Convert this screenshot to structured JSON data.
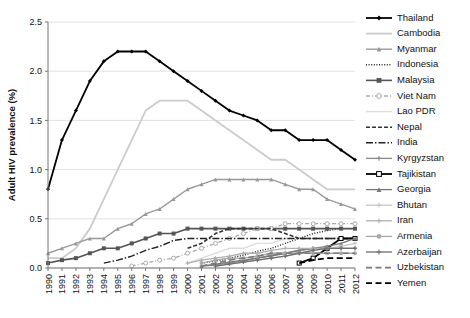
{
  "chart_data": {
    "type": "line",
    "title": "",
    "xlabel": "",
    "ylabel": "Adult HIV prevalence (%)",
    "xlim": [
      1990,
      2012
    ],
    "ylim": [
      0.0,
      2.5
    ],
    "yticks": [
      "0.0",
      "0.5",
      "1.0",
      "1.5",
      "2.0",
      "2.5"
    ],
    "ytick_values": [
      0.0,
      0.5,
      1.0,
      1.5,
      2.0,
      2.5
    ],
    "grid": "horizontal",
    "legend_position": "right",
    "x": [
      1990,
      1991,
      1992,
      1993,
      1994,
      1995,
      1996,
      1997,
      1998,
      1999,
      2000,
      2001,
      2002,
      2003,
      2004,
      2005,
      2006,
      2007,
      2008,
      2009,
      2010,
      2011,
      2012
    ],
    "xtick_labels": [
      "1990",
      "1991",
      "1992",
      "1993",
      "1994",
      "1995",
      "1996",
      "1997",
      "1998",
      "1999",
      "2000",
      "2001",
      "2002",
      "2003",
      "2004",
      "2005",
      "2006",
      "2007",
      "2008",
      "2009",
      "2010",
      "2011",
      "2012"
    ],
    "series": [
      {
        "name": "Thailand",
        "color": "#000000",
        "style": "solid",
        "marker": "diamond",
        "width": 1.8,
        "values": [
          0.8,
          1.3,
          1.6,
          1.9,
          2.1,
          2.2,
          2.2,
          2.2,
          2.1,
          2.0,
          1.9,
          1.8,
          1.7,
          1.6,
          1.55,
          1.5,
          1.4,
          1.4,
          1.3,
          1.3,
          1.3,
          1.2,
          1.1
        ]
      },
      {
        "name": "Cambodia",
        "color": "#cccccc",
        "style": "solid",
        "marker": "none",
        "width": 1.8,
        "values": [
          0.1,
          0.1,
          0.2,
          0.4,
          0.7,
          1.0,
          1.3,
          1.6,
          1.7,
          1.7,
          1.7,
          1.6,
          1.5,
          1.4,
          1.3,
          1.2,
          1.1,
          1.1,
          1.0,
          0.9,
          0.8,
          0.8,
          0.8
        ]
      },
      {
        "name": "Myanmar",
        "color": "#999999",
        "style": "solid",
        "marker": "triangle",
        "width": 1.4,
        "values": [
          0.15,
          0.2,
          0.25,
          0.3,
          0.3,
          0.4,
          0.45,
          0.55,
          0.6,
          0.7,
          0.8,
          0.85,
          0.9,
          0.9,
          0.9,
          0.9,
          0.9,
          0.85,
          0.8,
          0.8,
          0.7,
          0.65,
          0.6
        ]
      },
      {
        "name": "Indonesia",
        "color": "#222222",
        "style": "dotted",
        "marker": "none",
        "width": 1.4,
        "values": [
          null,
          null,
          null,
          null,
          null,
          null,
          null,
          null,
          null,
          null,
          null,
          0.05,
          0.07,
          0.1,
          0.13,
          0.17,
          0.2,
          0.25,
          0.3,
          0.35,
          0.38,
          0.4,
          0.4
        ]
      },
      {
        "name": "Malaysia",
        "color": "#555555",
        "style": "solid",
        "marker": "square",
        "width": 1.6,
        "values": [
          0.05,
          0.08,
          0.1,
          0.15,
          0.2,
          0.2,
          0.25,
          0.3,
          0.35,
          0.35,
          0.4,
          0.4,
          0.4,
          0.4,
          0.4,
          0.4,
          0.4,
          0.4,
          0.4,
          0.4,
          0.4,
          0.4,
          0.4
        ]
      },
      {
        "name": "Viet Nam",
        "color": "#aaaaaa",
        "style": "dashdot",
        "marker": "circle-open",
        "width": 1.3,
        "values": [
          null,
          null,
          null,
          null,
          null,
          null,
          0.02,
          0.05,
          0.08,
          0.1,
          0.15,
          0.2,
          0.25,
          0.3,
          0.35,
          0.4,
          0.4,
          0.45,
          0.45,
          0.45,
          0.45,
          0.45,
          0.45
        ]
      },
      {
        "name": "Lao PDR",
        "color": "#dddddd",
        "style": "solid",
        "marker": "none",
        "width": 1.4,
        "values": [
          null,
          null,
          null,
          null,
          null,
          null,
          null,
          null,
          null,
          null,
          0.05,
          0.1,
          0.15,
          0.2,
          0.2,
          0.25,
          0.25,
          0.3,
          0.3,
          0.3,
          0.3,
          0.3,
          0.3
        ]
      },
      {
        "name": "Nepal",
        "color": "#333333",
        "style": "dashed",
        "marker": "none",
        "width": 1.6,
        "values": [
          null,
          null,
          null,
          null,
          null,
          null,
          null,
          null,
          null,
          null,
          0.2,
          0.25,
          0.35,
          0.4,
          0.4,
          0.4,
          0.4,
          0.35,
          0.3,
          0.3,
          0.3,
          0.3,
          0.3
        ]
      },
      {
        "name": "India",
        "color": "#222222",
        "style": "dashdot-long",
        "marker": "none",
        "width": 1.4,
        "values": [
          null,
          null,
          null,
          null,
          0.05,
          0.08,
          0.12,
          0.18,
          0.22,
          0.28,
          0.3,
          0.3,
          0.3,
          0.3,
          0.3,
          0.3,
          0.3,
          0.3,
          0.3,
          0.3,
          0.3,
          0.3,
          0.3
        ]
      },
      {
        "name": "Kyrgyzstan",
        "color": "#888888",
        "style": "solid",
        "marker": "cross",
        "width": 1.3,
        "values": [
          null,
          null,
          null,
          null,
          null,
          null,
          null,
          null,
          null,
          null,
          null,
          0.02,
          0.03,
          0.05,
          0.07,
          0.1,
          0.13,
          0.15,
          0.18,
          0.2,
          0.2,
          0.2,
          0.2
        ]
      },
      {
        "name": "Tajikistan",
        "color": "#000000",
        "style": "solid",
        "marker": "square-open",
        "width": 1.8,
        "values": [
          null,
          null,
          null,
          null,
          null,
          null,
          null,
          null,
          null,
          null,
          null,
          null,
          null,
          null,
          null,
          null,
          null,
          null,
          0.05,
          0.1,
          0.2,
          0.3,
          0.3
        ]
      },
      {
        "name": "Georgia",
        "color": "#777777",
        "style": "solid",
        "marker": "triangle",
        "width": 1.3,
        "values": [
          null,
          null,
          null,
          null,
          null,
          null,
          null,
          null,
          null,
          null,
          null,
          0.02,
          0.04,
          0.06,
          0.08,
          0.1,
          0.12,
          0.15,
          0.18,
          0.2,
          0.22,
          0.25,
          0.3
        ]
      },
      {
        "name": "Bhutan",
        "color": "#c4c4c4",
        "style": "solid",
        "marker": "plus",
        "width": 1.3,
        "values": [
          null,
          null,
          null,
          null,
          null,
          null,
          null,
          null,
          null,
          null,
          null,
          null,
          0.02,
          0.04,
          0.06,
          0.08,
          0.1,
          0.12,
          0.15,
          0.18,
          0.2,
          0.22,
          0.25
        ]
      },
      {
        "name": "Iran",
        "color": "#b0b0b0",
        "style": "solid",
        "marker": "plus",
        "width": 1.3,
        "values": [
          null,
          null,
          null,
          null,
          null,
          null,
          null,
          null,
          null,
          null,
          0.05,
          0.08,
          0.1,
          0.12,
          0.15,
          0.15,
          0.18,
          0.2,
          0.2,
          0.2,
          0.2,
          0.2,
          0.2
        ]
      },
      {
        "name": "Armenia",
        "color": "#a8a8a8",
        "style": "solid",
        "marker": "circle",
        "width": 1.3,
        "values": [
          null,
          null,
          null,
          null,
          null,
          null,
          null,
          null,
          null,
          null,
          null,
          0.05,
          0.08,
          0.1,
          0.1,
          0.12,
          0.15,
          0.15,
          0.15,
          0.15,
          0.15,
          0.15,
          0.15
        ]
      },
      {
        "name": "Azerbaijan",
        "color": "#6e6e6e",
        "style": "solid",
        "marker": "plus",
        "width": 1.3,
        "values": [
          null,
          null,
          null,
          null,
          null,
          null,
          null,
          null,
          null,
          null,
          null,
          null,
          0.02,
          0.04,
          0.06,
          0.08,
          0.1,
          0.12,
          0.15,
          0.18,
          0.2,
          0.2,
          0.2
        ]
      },
      {
        "name": "Uzbekistan",
        "color": "#7a7a7a",
        "style": "longdash",
        "marker": "none",
        "width": 1.6,
        "values": [
          null,
          null,
          null,
          null,
          null,
          null,
          null,
          null,
          null,
          null,
          null,
          0.02,
          0.05,
          0.08,
          0.1,
          0.12,
          0.15,
          0.15,
          0.15,
          0.15,
          0.15,
          0.15,
          0.15
        ]
      },
      {
        "name": "Yemen",
        "color": "#000000",
        "style": "longdash",
        "marker": "none",
        "width": 1.8,
        "values": [
          null,
          null,
          null,
          null,
          null,
          null,
          null,
          null,
          null,
          null,
          null,
          null,
          null,
          null,
          null,
          null,
          null,
          null,
          0.05,
          0.08,
          0.1,
          0.1,
          0.1
        ]
      }
    ]
  }
}
